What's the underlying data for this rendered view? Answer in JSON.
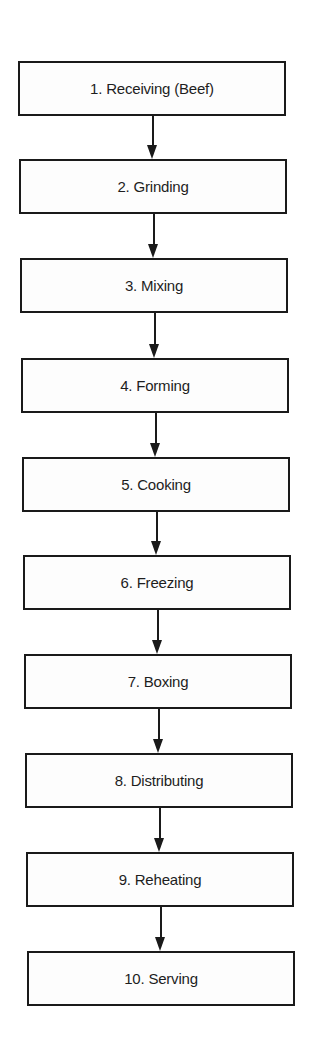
{
  "diagram": {
    "type": "flowchart",
    "direction": "top-to-bottom",
    "steps": [
      {
        "label": "1. Receiving (Beef)"
      },
      {
        "label": "2. Grinding"
      },
      {
        "label": "3. Mixing"
      },
      {
        "label": "4. Forming"
      },
      {
        "label": "5. Cooking"
      },
      {
        "label": "6. Freezing"
      },
      {
        "label": "7. Boxing"
      },
      {
        "label": "8. Distributing"
      },
      {
        "label": "9. Reheating"
      },
      {
        "label": "10. Serving"
      }
    ],
    "edges": [
      {
        "from": 1,
        "to": 2
      },
      {
        "from": 2,
        "to": 3
      },
      {
        "from": 3,
        "to": 4
      },
      {
        "from": 4,
        "to": 5
      },
      {
        "from": 5,
        "to": 6
      },
      {
        "from": 6,
        "to": 7
      },
      {
        "from": 7,
        "to": 8
      },
      {
        "from": 8,
        "to": 9
      },
      {
        "from": 9,
        "to": 10
      }
    ]
  }
}
